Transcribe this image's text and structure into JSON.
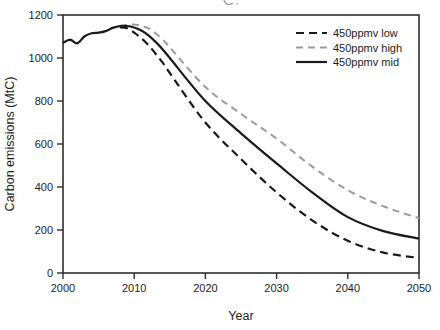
{
  "figure": {
    "background": "#ffffff",
    "border_color": "#2e2e2e",
    "text_color": "#1c1c1c"
  },
  "chart_data": {
    "type": "line",
    "title": "",
    "xlabel": "Year",
    "ylabel": "Carbon emissions (MtC)",
    "xlim": [
      2000,
      2050
    ],
    "ylim": [
      0,
      1200
    ],
    "x_ticks": [
      2000,
      2010,
      2020,
      2030,
      2040,
      2050
    ],
    "y_ticks": [
      0,
      200,
      400,
      600,
      800,
      1000,
      1200
    ],
    "grid": false,
    "legend_position": "top-right-inside",
    "series": [
      {
        "name": "450ppmv low",
        "color": "#1a1a1a",
        "style": "dashed",
        "dash": "8 5",
        "width": 2.2,
        "points": [
          [
            2008,
            1143
          ],
          [
            2009,
            1138
          ],
          [
            2010,
            1118
          ],
          [
            2011,
            1092
          ],
          [
            2012,
            1060
          ],
          [
            2013,
            1020
          ],
          [
            2014,
            978
          ],
          [
            2015,
            930
          ],
          [
            2020,
            700
          ],
          [
            2025,
            530
          ],
          [
            2030,
            375
          ],
          [
            2035,
            245
          ],
          [
            2040,
            150
          ],
          [
            2045,
            95
          ],
          [
            2050,
            70
          ]
        ]
      },
      {
        "name": "450ppmv high",
        "color": "#9b9b9b",
        "style": "dashed",
        "dash": "7 5",
        "width": 2.0,
        "points": [
          [
            2008,
            1150
          ],
          [
            2009,
            1154
          ],
          [
            2010,
            1156
          ],
          [
            2011,
            1150
          ],
          [
            2012,
            1138
          ],
          [
            2013,
            1115
          ],
          [
            2014,
            1085
          ],
          [
            2015,
            1050
          ],
          [
            2020,
            865
          ],
          [
            2025,
            740
          ],
          [
            2030,
            625
          ],
          [
            2035,
            495
          ],
          [
            2040,
            385
          ],
          [
            2045,
            310
          ],
          [
            2050,
            255
          ]
        ]
      },
      {
        "name": "450ppmv mid",
        "color": "#1a1a1a",
        "style": "solid",
        "dash": "",
        "width": 2.2,
        "points": [
          [
            2000,
            1070
          ],
          [
            2001,
            1085
          ],
          [
            2002,
            1068
          ],
          [
            2003,
            1100
          ],
          [
            2004,
            1115
          ],
          [
            2005,
            1118
          ],
          [
            2006,
            1125
          ],
          [
            2007,
            1140
          ],
          [
            2008,
            1148
          ],
          [
            2009,
            1149
          ],
          [
            2010,
            1142
          ],
          [
            2011,
            1128
          ],
          [
            2012,
            1105
          ],
          [
            2013,
            1075
          ],
          [
            2014,
            1040
          ],
          [
            2015,
            1000
          ],
          [
            2020,
            800
          ],
          [
            2025,
            650
          ],
          [
            2030,
            510
          ],
          [
            2035,
            375
          ],
          [
            2040,
            260
          ],
          [
            2045,
            195
          ],
          [
            2050,
            160
          ]
        ]
      }
    ]
  }
}
